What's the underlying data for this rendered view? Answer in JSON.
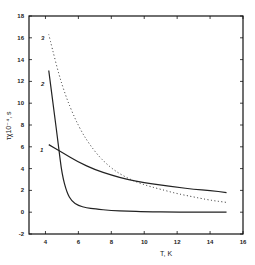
{
  "chart_data": {
    "type": "line",
    "title": "",
    "xlabel": "T, K",
    "ylabel": "τχ10⁻⁴, s",
    "xlim": [
      3,
      16
    ],
    "ylim": [
      -2,
      18
    ],
    "xticks": [
      4,
      6,
      8,
      10,
      12,
      14,
      16
    ],
    "yticks": [
      -2,
      0,
      2,
      4,
      6,
      8,
      10,
      12,
      14,
      16,
      18
    ],
    "grid": false,
    "legend": "none (curves labeled inline 1, 2, 3)",
    "series": [
      {
        "name": "1",
        "style": "solid",
        "x": [
          4.2,
          5,
          6,
          7,
          8,
          9,
          10,
          11,
          12,
          13,
          14,
          15
        ],
        "y": [
          6.2,
          5.5,
          4.6,
          3.9,
          3.4,
          3.0,
          2.7,
          2.5,
          2.3,
          2.1,
          2.0,
          1.8
        ]
      },
      {
        "name": "2",
        "style": "solid",
        "x": [
          4.2,
          4.5,
          4.8,
          5.0,
          5.3,
          5.6,
          6.0,
          6.5,
          7,
          8,
          9,
          10,
          12,
          15
        ],
        "y": [
          13.0,
          9.5,
          6.0,
          3.5,
          1.8,
          1.0,
          0.6,
          0.4,
          0.3,
          0.15,
          0.1,
          0.05,
          0.0,
          0.0
        ]
      },
      {
        "name": "3",
        "style": "dotted",
        "x": [
          4.2,
          5,
          6,
          7,
          8,
          9,
          10,
          11,
          12,
          13,
          14,
          15
        ],
        "y": [
          16.3,
          11.5,
          7.8,
          5.5,
          4.0,
          3.1,
          2.5,
          2.1,
          1.7,
          1.4,
          1.1,
          0.9
        ]
      }
    ],
    "labels": {
      "c1": "1",
      "c2": "2",
      "c3": "3"
    }
  }
}
